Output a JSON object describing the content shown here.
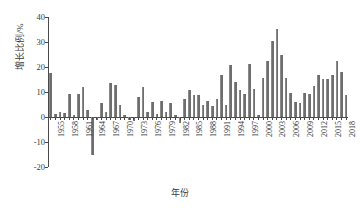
{
  "chart_data": {
    "type": "bar",
    "title": "",
    "subtitle": "",
    "xlabel": "年份",
    "ylabel": "增长比例/%",
    "ylim": [
      -20,
      40
    ],
    "yticks": [
      40,
      30,
      20,
      10,
      0,
      -10,
      -20
    ],
    "ytick_labels": [
      "40",
      "30",
      "20",
      "10",
      "0",
      "-10",
      "-20"
    ],
    "grid": false,
    "legend": null,
    "legend_position": "none",
    "bar_color": "#6e6e6e",
    "axis_color": "#4a4a4a",
    "xtick_step": 3,
    "xtick_labels": [
      "1955",
      "1958",
      "1961",
      "1964",
      "1967",
      "1970",
      "1973",
      "1976",
      "1979",
      "1982",
      "1985",
      "1988",
      "1991",
      "1994",
      "1997",
      "2000",
      "2003",
      "2006",
      "2009",
      "2012",
      "2015",
      "2018"
    ],
    "categories": [
      1954,
      1955,
      1956,
      1957,
      1958,
      1959,
      1960,
      1961,
      1962,
      1963,
      1964,
      1965,
      1966,
      1967,
      1968,
      1969,
      1970,
      1971,
      1972,
      1973,
      1974,
      1975,
      1976,
      1977,
      1978,
      1979,
      1980,
      1981,
      1982,
      1983,
      1984,
      1985,
      1986,
      1987,
      1988,
      1989,
      1990,
      1991,
      1992,
      1993,
      1994,
      1995,
      1996,
      1997,
      1998,
      1999,
      2000,
      2001,
      2002,
      2003,
      2004,
      2005,
      2006,
      2007,
      2008,
      2009,
      2010,
      2011,
      2012,
      2013,
      2014,
      2015,
      2016,
      2017,
      2018
    ],
    "values": [
      17.5,
      1.2,
      2.0,
      1.5,
      9.4,
      1.0,
      9.3,
      12.0,
      3.0,
      -15.2,
      -1.0,
      5.5,
      2.0,
      13.5,
      12.8,
      4.8,
      1.0,
      -1.2,
      -1.5,
      8.0,
      12.0,
      2.0,
      6.0,
      1.4,
      6.3,
      2.0,
      5.5,
      1.0,
      -2.2,
      7.3,
      11.0,
      8.8,
      9.0,
      5.0,
      6.5,
      4.5,
      7.4,
      16.8,
      5.0,
      21.0,
      14.2,
      11.0,
      9.4,
      21.2,
      11.2,
      1.0,
      15.5,
      22.5,
      30.3,
      35.2,
      24.8,
      15.7,
      9.5,
      6.0,
      5.7,
      9.5,
      9.2,
      12.4,
      17.0,
      15.4,
      15.2,
      17.0,
      22.6,
      17.9,
      8.8
    ],
    "series_values_extended": [
      18.0,
      15.2,
      18.0,
      10.0,
      9.0,
      7.5,
      7.0,
      9.5
    ],
    "peak": {
      "year": 1994,
      "value": 35.2
    },
    "trough": {
      "year": 1961,
      "value": -15.2
    }
  }
}
